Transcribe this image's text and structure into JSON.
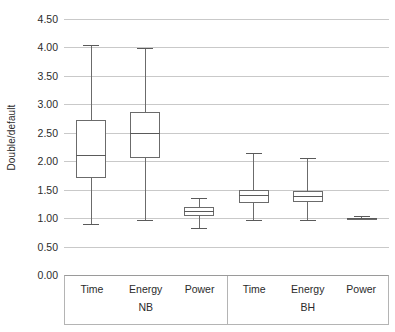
{
  "chart_data": {
    "type": "box",
    "title": "",
    "xlabel": "",
    "ylabel": "Double/default",
    "ylim": [
      0.0,
      4.5
    ],
    "ytick_step": 0.5,
    "yticks": [
      "4.50",
      "4.00",
      "3.50",
      "3.00",
      "2.50",
      "2.00",
      "1.50",
      "1.00",
      "0.50",
      "0.00"
    ],
    "ytick_values": [
      4.5,
      4.0,
      3.5,
      3.0,
      2.5,
      2.0,
      1.5,
      1.0,
      0.5,
      0.0
    ],
    "grid": true,
    "legend": "none",
    "categories": [
      "Time",
      "Energy",
      "Power",
      "Time",
      "Energy",
      "Power"
    ],
    "groups": [
      {
        "name": "NB",
        "categories": [
          "Time",
          "Energy",
          "Power"
        ]
      },
      {
        "name": "BH",
        "categories": [
          "Time",
          "Energy",
          "Power"
        ]
      }
    ],
    "boxes": [
      {
        "group": "NB",
        "category": "Time",
        "min": 0.9,
        "q1": 1.7,
        "median": 2.11,
        "q3": 2.73,
        "max": 4.04
      },
      {
        "group": "NB",
        "category": "Energy",
        "min": 0.97,
        "q1": 2.05,
        "median": 2.5,
        "q3": 2.87,
        "max": 3.99
      },
      {
        "group": "NB",
        "category": "Power",
        "min": 0.83,
        "q1": 1.04,
        "median": 1.13,
        "q3": 1.2,
        "max": 1.36
      },
      {
        "group": "BH",
        "category": "Time",
        "min": 0.96,
        "q1": 1.27,
        "median": 1.4,
        "q3": 1.5,
        "max": 2.15
      },
      {
        "group": "BH",
        "category": "Energy",
        "min": 0.97,
        "q1": 1.28,
        "median": 1.38,
        "q3": 1.48,
        "max": 2.06
      },
      {
        "group": "BH",
        "category": "Power",
        "min": 0.98,
        "q1": 0.99,
        "median": 1.0,
        "q3": 1.01,
        "max": 1.03
      }
    ],
    "colors": {
      "background": "#ffffff",
      "gridline": "#c9c9c9",
      "box_stroke": "#6b6b6b",
      "box_fill": "#ffffff",
      "whisker": "#6b6b6b",
      "median": "#5a5a5a",
      "text": "#2b2b2b",
      "axis_table_border": "#b4b4b4"
    }
  }
}
